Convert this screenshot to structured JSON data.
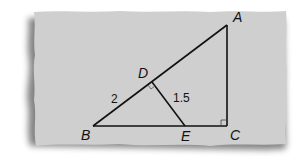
{
  "figure": {
    "type": "geometry",
    "colors": {
      "paper": "#cfcfcf",
      "shadow": "#6e6e6e",
      "line": "#111111"
    },
    "points": {
      "A": {
        "label": "A",
        "x": 227,
        "y": 25
      },
      "B": {
        "label": "B",
        "x": 93,
        "y": 126
      },
      "C": {
        "label": "C",
        "x": 227,
        "y": 126
      },
      "D": {
        "label": "D",
        "x": 152,
        "y": 82
      },
      "E": {
        "label": "E",
        "x": 185,
        "y": 126
      }
    },
    "segments": [
      "AB",
      "BC",
      "CA",
      "DE"
    ],
    "right_angles": [
      "C",
      "D"
    ],
    "measures": {
      "BD": "2",
      "DE": "1.5"
    }
  }
}
